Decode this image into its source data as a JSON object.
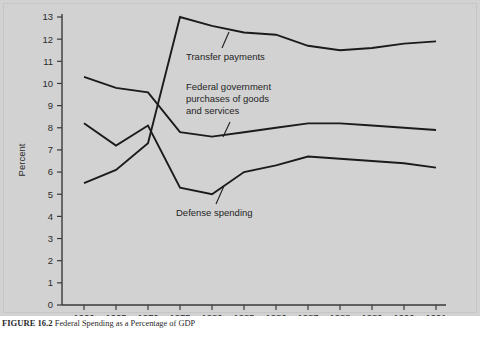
{
  "figure": {
    "caption_number": "FIGURE 16.2",
    "caption_text": "Federal Spending as a Percentage of GDP"
  },
  "chart_data": {
    "type": "line",
    "title": "",
    "xlabel": "",
    "ylabel": "Percent",
    "ylim": [
      0,
      13
    ],
    "ytick_values": [
      0,
      1,
      2,
      3,
      4,
      5,
      6,
      7,
      8,
      9,
      10,
      11,
      12,
      13
    ],
    "ytick_labels": [
      "0",
      "1",
      "2",
      "3",
      "4",
      "5",
      "6",
      "7",
      "8",
      "9",
      "10",
      "11",
      "12",
      "13"
    ],
    "x": [
      1960,
      1965,
      1970,
      1975,
      1980,
      1985,
      1986,
      1987,
      1988,
      1989,
      1990,
      1991
    ],
    "xtick_labels": [
      "1960",
      "1965",
      "1970",
      "1975",
      "1980",
      "1985",
      "1986",
      "1987",
      "1988",
      "1989",
      "1990",
      "1991"
    ],
    "grid": false,
    "legend": "inline-annotations",
    "series": [
      {
        "name": "Transfer payments",
        "values": [
          5.5,
          6.1,
          7.3,
          13.0,
          12.6,
          12.3,
          12.2,
          11.7,
          11.5,
          11.6,
          11.8,
          11.9
        ]
      },
      {
        "name": "Federal government purchases of goods and services",
        "values": [
          10.3,
          9.8,
          9.6,
          7.8,
          7.6,
          7.8,
          8.0,
          8.2,
          8.2,
          8.1,
          8.0,
          7.9
        ]
      },
      {
        "name": "Defense spending",
        "values": [
          8.2,
          7.2,
          8.1,
          5.3,
          5.0,
          6.0,
          6.3,
          6.7,
          6.6,
          6.5,
          6.4,
          6.2
        ]
      }
    ],
    "annotations": [
      {
        "id": "transfer-payments",
        "label": "Transfer payments"
      },
      {
        "id": "federal-purchases",
        "label_line_1": "Federal government",
        "label_line_2": "purchases of goods",
        "label_line_3": "and services"
      },
      {
        "id": "defense-spending",
        "label": "Defense spending"
      }
    ],
    "colors": {
      "background": "#d2d2d2",
      "line": "#1b1b1b",
      "axis": "#3a3a3a",
      "text": "#2b2b2b"
    }
  }
}
